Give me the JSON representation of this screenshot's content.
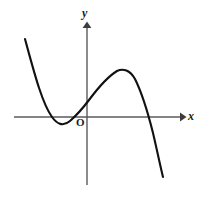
{
  "figure": {
    "name": "cubic-function-graph",
    "background_color": "#ffffff",
    "width": 203,
    "height": 198
  },
  "axes": {
    "x_label": "x",
    "y_label": "y",
    "origin_label": "O",
    "axis_color": "#5a5a5a",
    "axis_line_width": 1.4,
    "x_axis": {
      "y_pixel": 117,
      "start_x_pixel": 14,
      "end_x_pixel": 184,
      "has_arrow": true,
      "arrow_direction": "right"
    },
    "y_axis": {
      "x_pixel": 87,
      "start_y_pixel": 185,
      "end_y_pixel": 22,
      "has_arrow": true,
      "arrow_direction": "up"
    }
  },
  "chart_data": {
    "type": "line",
    "title": "",
    "xlabel": "x",
    "ylabel": "y",
    "grid": false,
    "legend": null,
    "curve_color": "#111111",
    "curve_line_width": 2.1,
    "features": {
      "local_minimum": {
        "x_pixel": 60,
        "y_pixel": 126
      },
      "local_maximum": {
        "x_pixel": 124,
        "y_pixel": 70
      },
      "y_intercept": {
        "x_pixel": 87,
        "y_pixel": 103
      },
      "x_intercepts": [
        {
          "x_pixel": 47,
          "y_pixel": 117
        },
        {
          "x_pixel": 74,
          "y_pixel": 117
        },
        {
          "x_pixel": 150,
          "y_pixel": 117
        }
      ],
      "left_endpoint": {
        "x_pixel": 25,
        "y_pixel": 39
      },
      "right_endpoint": {
        "x_pixel": 163,
        "y_pixel": 177
      }
    },
    "points_pixel": [
      [
        25,
        39
      ],
      [
        29,
        54
      ],
      [
        33,
        68
      ],
      [
        37,
        81
      ],
      [
        41,
        93
      ],
      [
        45,
        103
      ],
      [
        49,
        112
      ],
      [
        53,
        119
      ],
      [
        57,
        124
      ],
      [
        61,
        126
      ],
      [
        65,
        125
      ],
      [
        69,
        122
      ],
      [
        73,
        117
      ],
      [
        77,
        112
      ],
      [
        81,
        108
      ],
      [
        85,
        104
      ],
      [
        89,
        100
      ],
      [
        93,
        95
      ],
      [
        97,
        90
      ],
      [
        101,
        86
      ],
      [
        105,
        82
      ],
      [
        109,
        78
      ],
      [
        113,
        75
      ],
      [
        117,
        72
      ],
      [
        121,
        70
      ],
      [
        125,
        70
      ],
      [
        129,
        71
      ],
      [
        133,
        74
      ],
      [
        137,
        80
      ],
      [
        141,
        90
      ],
      [
        145,
        102
      ],
      [
        149,
        115
      ],
      [
        153,
        131
      ],
      [
        157,
        148
      ],
      [
        160,
        163
      ],
      [
        163,
        177
      ]
    ],
    "path_d": "M 25 39 C 34 72, 42 103, 52 117 C 57 124, 63 127, 70 121 C 78 114, 83 108, 89 100 C 98 88, 107 77, 117 71 C 123 68, 130 70, 135 79 C 142 93, 148 113, 153 133 C 157 150, 160 165, 163 177"
  }
}
